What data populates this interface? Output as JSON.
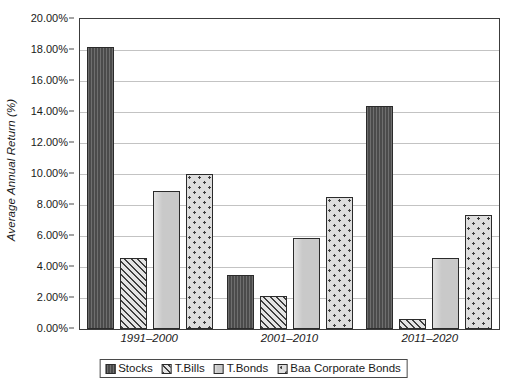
{
  "chart_data": {
    "type": "bar",
    "title": "",
    "subtitle": "",
    "xlabel": "",
    "ylabel": "Average Annual Return (%)",
    "categories": [
      "1991–2000",
      "2001–2010",
      "2011–2020"
    ],
    "series": [
      {
        "name": "Stocks",
        "pattern": "solid-dark",
        "values": [
          18.2,
          3.5,
          14.4
        ]
      },
      {
        "name": "T.Bills",
        "pattern": "diagonal",
        "values": [
          4.6,
          2.15,
          0.65
        ]
      },
      {
        "name": "T.Bonds",
        "pattern": "light-solid",
        "values": [
          8.9,
          5.85,
          4.6
        ]
      },
      {
        "name": "Baa Corporate Bonds",
        "pattern": "dotted",
        "values": [
          10.0,
          8.5,
          7.35
        ]
      }
    ],
    "ylim": [
      0,
      20
    ],
    "ytick_step": 2,
    "ytick_labels": [
      "0.00%",
      "2.00%",
      "4.00%",
      "6.00%",
      "8.00%",
      "10.00%",
      "12.00%",
      "14.00%",
      "16.00%",
      "18.00%",
      "20.00%"
    ],
    "grid": true,
    "grid_axis": "y",
    "legend_position": "bottom-center",
    "colors": {
      "stocks": "#4b4b4b",
      "tbills": "#d6d6d6",
      "tbonds": "#c9c9c9",
      "baa": "#dedede",
      "axis": "#3c3c3c",
      "gridline": "#c3c3c3",
      "text": "#1a1a1a",
      "background": "#ffffff"
    }
  }
}
